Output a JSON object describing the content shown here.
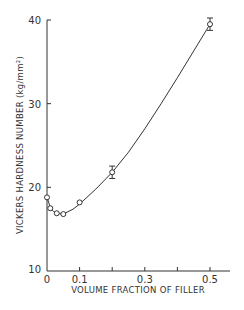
{
  "chart_data": {
    "type": "line",
    "title": "",
    "xlabel": "VOLUME FRACTION OF FILLER",
    "ylabel": "VICKERS HARDNESS NUMBER (kg/mm²)",
    "xlim": [
      0,
      0.6
    ],
    "ylim": [
      10,
      40
    ],
    "x_ticks": [
      0,
      0.1,
      0.2,
      0.3,
      0.4,
      0.5
    ],
    "x_tick_labels": [
      "0",
      "0.1",
      "",
      "0.3",
      "",
      "0.5"
    ],
    "y_ticks": [
      10,
      20,
      30,
      40
    ],
    "y_tick_labels": [
      "10",
      "20",
      "30",
      "40"
    ],
    "grid": false,
    "legend": null,
    "series": [
      {
        "name": "measured",
        "marker": "open-circle",
        "x": [
          0,
          0.01,
          0.03,
          0.05,
          0.1,
          0.2,
          0.5
        ],
        "y": [
          18.8,
          17.5,
          16.9,
          16.8,
          18.2,
          21.8,
          39.5
        ],
        "error": [
          0,
          0,
          0,
          0,
          0,
          0.5,
          0.5
        ]
      },
      {
        "name": "fit-curve",
        "marker": "none",
        "x": [
          0,
          0.01,
          0.02,
          0.03,
          0.05,
          0.08,
          0.1,
          0.15,
          0.2,
          0.25,
          0.3,
          0.35,
          0.4,
          0.45,
          0.5
        ],
        "y": [
          18.8,
          17.6,
          17.1,
          16.9,
          16.8,
          17.4,
          18.0,
          19.8,
          21.8,
          24.2,
          27.0,
          30.0,
          33.1,
          36.3,
          39.5
        ]
      }
    ]
  }
}
